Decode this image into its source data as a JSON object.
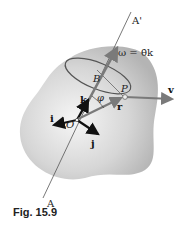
{
  "figure": {
    "caption": "Fig. 15.9",
    "labels": {
      "axis_top": "A'",
      "axis_bottom": "A",
      "omega": "ω = θ̇k",
      "point_b": "B",
      "point_p": "P",
      "origin": "O",
      "angle": "φ",
      "unit_i": "i",
      "unit_j": "j",
      "unit_k": "k",
      "position_r": "r",
      "velocity_v": "v"
    },
    "colors": {
      "body_fill_center": "#f4f4f4",
      "body_fill_edge": "#b8b8b8",
      "vector_gray": "#7a7a7a",
      "vector_black": "#111111",
      "circle_stroke": "#555555",
      "axis_line": "#555555"
    }
  }
}
